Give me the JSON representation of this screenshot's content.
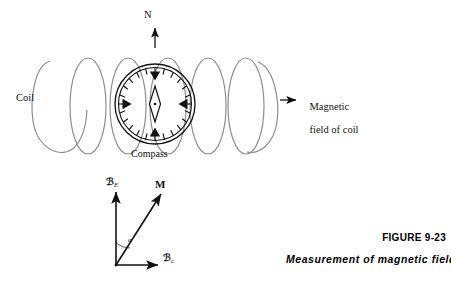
{
  "figure": {
    "domain": "physics-diagram",
    "caption_number": "FIGURE 9-23",
    "caption_title": "Measurement of magnetic field",
    "colors": {
      "coil": "#8a8a8a",
      "ink": "#111111",
      "background": "#ffffff"
    }
  },
  "labels": {
    "north": "N",
    "coil": "Coil",
    "compass": "Compass",
    "field_of_coil_line1": "Magnetic",
    "field_of_coil_line2": "field of coil"
  },
  "vectors": {
    "earth_field_symbol": "ℬ",
    "earth_field_subscript": "E",
    "coil_field_symbol": "ℬ",
    "coil_field_subscript": "c",
    "resultant_label": "M",
    "angle_label": "α"
  },
  "coil": {
    "loop_count": 6,
    "description": "helix of overlapping ellipses viewed from the side"
  },
  "compass": {
    "cardinal_marker_count": 4,
    "tick_count": 24,
    "needle": "diamond"
  }
}
